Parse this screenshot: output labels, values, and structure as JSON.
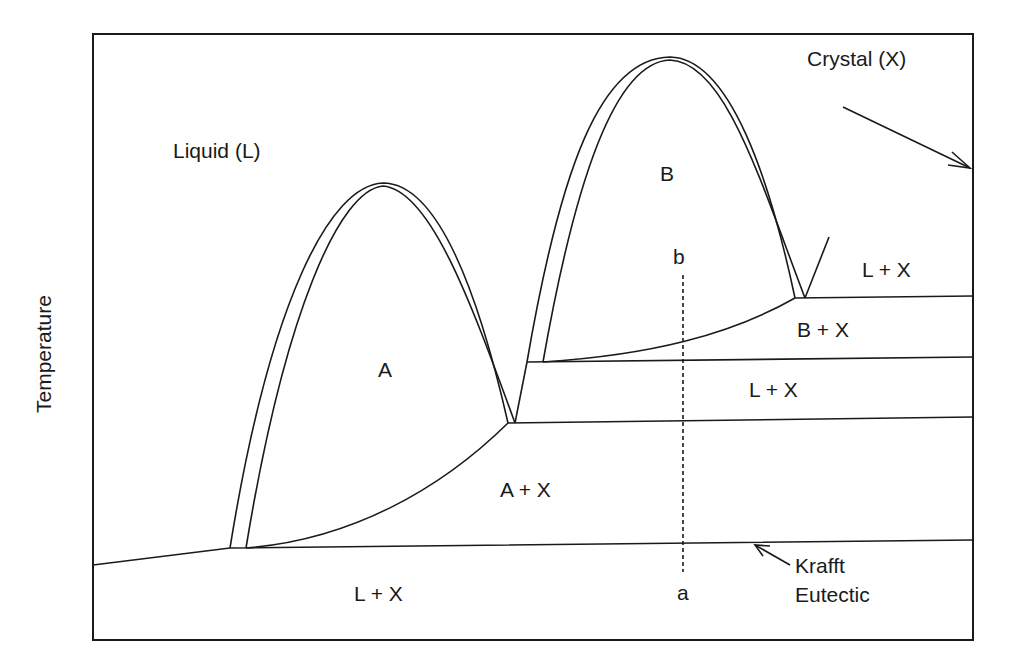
{
  "diagram": {
    "type": "phase-diagram",
    "axis": {
      "ylabel": "Temperature"
    },
    "labels": {
      "liquid": "Liquid (L)",
      "crystal": "Crystal (X)",
      "phase_a": "A",
      "phase_b": "B",
      "a_plus_x": "A + X",
      "b_plus_x": "B + X",
      "l_plus_x_top": "L + X",
      "l_plus_x_middle": "L + X",
      "l_plus_x_bottom": "L + X",
      "point_a": "a",
      "point_b": "b",
      "krafft_line1": "Krafft",
      "krafft_line2": "Eutectic"
    },
    "colors": {
      "ink": "#1a1a1a",
      "background": "#ffffff"
    }
  }
}
